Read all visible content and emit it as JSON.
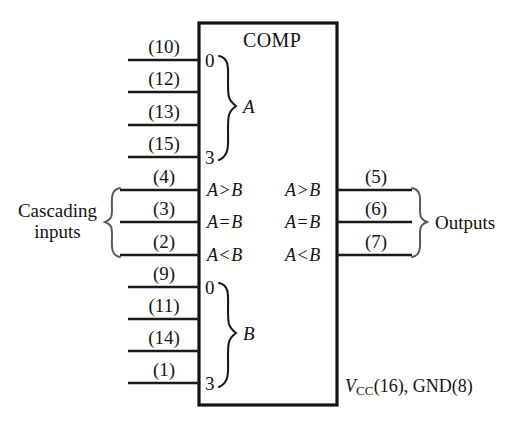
{
  "figure": {
    "type": "logic-block-diagram",
    "device_label": "COMP",
    "power_note": {
      "rail": "V",
      "rail_sub": "CC",
      "text_after": "(16), GND(8)"
    }
  },
  "block": {
    "title": "COMP",
    "a_group_letter": "A",
    "b_group_letter": "B",
    "a_group_top_index": "0",
    "a_group_bottom_index": "3",
    "b_group_top_index": "0",
    "b_group_bottom_index": "3"
  },
  "inputs_a": [
    {
      "pin": "(10)",
      "bit": "0"
    },
    {
      "pin": "(12)",
      "bit": "1"
    },
    {
      "pin": "(13)",
      "bit": "2"
    },
    {
      "pin": "(15)",
      "bit": "3"
    }
  ],
  "inputs_b": [
    {
      "pin": "(9)",
      "bit": "0"
    },
    {
      "pin": "(11)",
      "bit": "1"
    },
    {
      "pin": "(14)",
      "bit": "2"
    },
    {
      "pin": "(1)",
      "bit": "3"
    }
  ],
  "cascading_inputs": {
    "label_line1": "Cascading",
    "label_line2": "inputs",
    "items": [
      {
        "pin": "(4)",
        "expr_a": "A",
        "expr_op": ">",
        "expr_b": "B"
      },
      {
        "pin": "(3)",
        "expr_a": "A",
        "expr_op": "=",
        "expr_b": "B"
      },
      {
        "pin": "(2)",
        "expr_a": "A",
        "expr_op": "<",
        "expr_b": "B"
      }
    ]
  },
  "outputs": {
    "label": "Outputs",
    "items": [
      {
        "pin": "(5)",
        "expr_a": "A",
        "expr_op": ">",
        "expr_b": "B"
      },
      {
        "pin": "(6)",
        "expr_a": "A",
        "expr_op": "=",
        "expr_b": "B"
      },
      {
        "pin": "(7)",
        "expr_a": "A",
        "expr_op": "<",
        "expr_b": "B"
      }
    ]
  },
  "colors": {
    "ink": "#15120f",
    "line": "#1a1a1a",
    "background": "#ffffff"
  }
}
